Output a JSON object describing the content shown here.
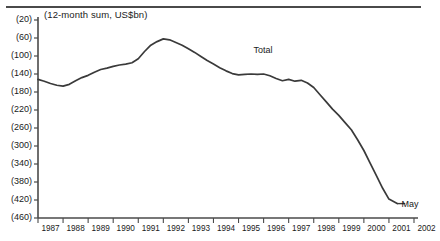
{
  "figure": {
    "title": "(12-month sum, US$bn)",
    "top_rule": "horizontal-rule"
  },
  "chart_data": {
    "type": "line",
    "title": "(12-month sum, US$bn)",
    "subtitle": "",
    "xlabel": "",
    "ylabel": "",
    "note": "Y axis values shown in parentheses denote negative US$bn (deficit). Axis is inverted: least negative at top.",
    "ylim": [
      -460,
      -20
    ],
    "yticks": [
      -20,
      -60,
      -100,
      -140,
      -180,
      -220,
      -260,
      -300,
      -340,
      -380,
      -420,
      -460
    ],
    "ytick_labels": [
      "(20)",
      "(60)",
      "(100)",
      "(140)",
      "(180)",
      "(220)",
      "(260)",
      "(300)",
      "(340)",
      "(380)",
      "(420)",
      "(460)"
    ],
    "xlim": [
      1987,
      2002
    ],
    "xticks": [
      1987,
      1988,
      1989,
      1990,
      1991,
      1992,
      1993,
      1994,
      1995,
      1996,
      1997,
      1998,
      1999,
      2000,
      2001,
      2002
    ],
    "xtick_labels": [
      "1987",
      "1988",
      "1989",
      "1990",
      "1991",
      "1992",
      "1993",
      "1994",
      "1995",
      "1996",
      "1997",
      "1998",
      "1999",
      "2000",
      "2001",
      "2002"
    ],
    "grid": false,
    "legend_position": "inline-annotation",
    "series": [
      {
        "name": "Total",
        "color": "#3a3a3a",
        "x": [
          1987.0,
          1987.25,
          1987.5,
          1987.75,
          1988.0,
          1988.25,
          1988.5,
          1988.75,
          1989.0,
          1989.25,
          1989.5,
          1989.75,
          1990.0,
          1990.25,
          1990.5,
          1990.75,
          1991.0,
          1991.25,
          1991.5,
          1991.75,
          1992.0,
          1992.25,
          1992.5,
          1992.75,
          1993.0,
          1993.25,
          1993.5,
          1993.75,
          1994.0,
          1994.25,
          1994.5,
          1994.75,
          1995.0,
          1995.25,
          1995.5,
          1995.75,
          1996.0,
          1996.25,
          1996.5,
          1996.75,
          1997.0,
          1997.25,
          1997.5,
          1997.75,
          1998.0,
          1998.25,
          1998.5,
          1998.75,
          1999.0,
          1999.25,
          1999.5,
          1999.75,
          2000.0,
          2000.25,
          2000.5,
          2000.75,
          2001.0,
          2001.33
        ],
        "values": [
          -152,
          -156,
          -161,
          -165,
          -167,
          -163,
          -155,
          -148,
          -143,
          -136,
          -130,
          -127,
          -123,
          -120,
          -118,
          -115,
          -106,
          -90,
          -76,
          -68,
          -62,
          -64,
          -70,
          -76,
          -84,
          -92,
          -101,
          -110,
          -118,
          -126,
          -133,
          -139,
          -142,
          -141,
          -140,
          -141,
          -140,
          -144,
          -150,
          -155,
          -152,
          -156,
          -154,
          -160,
          -170,
          -186,
          -202,
          -218,
          -232,
          -248,
          -264,
          -286,
          -310,
          -338,
          -366,
          -394,
          -418,
          -428
        ]
      }
    ],
    "annotations": [
      {
        "text": "Total",
        "x": 1995.6,
        "y": -88,
        "name": "series-label-total"
      },
      {
        "text": "May",
        "x": 2001.5,
        "y": -430,
        "name": "point-label-may"
      }
    ]
  }
}
